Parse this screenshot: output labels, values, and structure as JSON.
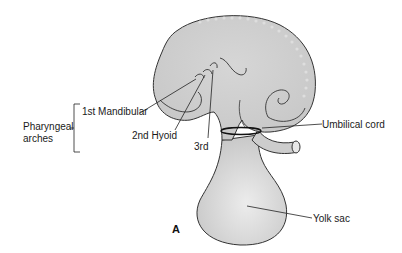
{
  "figure": {
    "panel_label": "A",
    "group_label_line1": "Pharyngeal",
    "group_label_line2": "arches",
    "labels": {
      "first_arch": "1st Mandibular",
      "second_arch": "2nd Hyoid",
      "third_arch": "3rd",
      "umbilical_cord": "Umbilical cord",
      "yolk_sac": "Yolk sac"
    },
    "colors": {
      "tissue_fill": "#cfcfcf",
      "tissue_highlight": "#e6e6e6",
      "outline": "#333333",
      "leader": "#222222"
    }
  }
}
